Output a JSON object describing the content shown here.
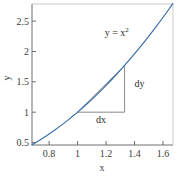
{
  "chart_data": {
    "type": "line",
    "title": "",
    "xlabel": "x",
    "ylabel": "y",
    "xlim": [
      0.68,
      1.67
    ],
    "ylim": [
      0.46,
      2.78
    ],
    "grid": false,
    "legend": null,
    "xticks": [
      0.8,
      1,
      1.2,
      1.4,
      1.6
    ],
    "xticklabels": [
      "0.8",
      "1",
      "1.2",
      "1.4",
      "1.6"
    ],
    "yticks": [
      0.5,
      1,
      1.5,
      2,
      2.5
    ],
    "yticklabels": [
      "0.5",
      "1",
      "1.5",
      "2",
      "2.5"
    ],
    "series": [
      {
        "name": "y = x^2",
        "color": "#3a6fa8",
        "linewidth": 1.2,
        "x": [
          0.68,
          0.73,
          0.78,
          0.83,
          0.88,
          0.93,
          0.98,
          1.03,
          1.08,
          1.13,
          1.18,
          1.23,
          1.28,
          1.33,
          1.38,
          1.43,
          1.48,
          1.53,
          1.58,
          1.63,
          1.67
        ],
        "y": [
          0.4624,
          0.5329,
          0.6084,
          0.6889,
          0.7744,
          0.8649,
          0.9604,
          1.0609,
          1.1664,
          1.2769,
          1.3924,
          1.5129,
          1.6384,
          1.7689,
          1.9044,
          2.0449,
          2.1904,
          2.3409,
          2.4964,
          2.6569,
          2.7889
        ]
      }
    ],
    "annotations": {
      "curve_label": {
        "text": "y = x",
        "superscript": "2",
        "x": 1.19,
        "y": 2.26
      },
      "secant": {
        "color": "#8c8c8c",
        "linewidth": 1,
        "x0": 1.0,
        "y0": 1.0,
        "x1": 1.33,
        "y1": 1.7689
      },
      "dy_leg": {
        "label": "dy",
        "x": 1.33,
        "y_from": 1.0,
        "y_to": 1.7689,
        "label_x": 1.4,
        "label_y": 1.42
      },
      "dx_leg": {
        "label": "dx",
        "y": 1.0,
        "x_from": 1.0,
        "x_to": 1.33,
        "label_x": 1.165,
        "label_y": 0.83
      }
    },
    "style": {
      "axis_color": "#6e6e6e",
      "tick_color": "#6e6e6e",
      "text_color": "#3c3c3c",
      "background": "#ffffff"
    }
  }
}
